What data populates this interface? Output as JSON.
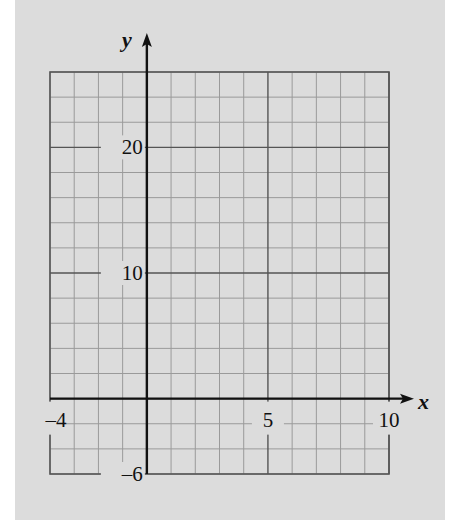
{
  "chart_data": {
    "type": "line",
    "title": "",
    "xlabel": "x",
    "ylabel": "y",
    "xlim": [
      -4,
      10
    ],
    "ylim": [
      -6,
      26
    ],
    "x_ticks": [
      {
        "value": -4,
        "label": "–4"
      },
      {
        "value": 5,
        "label": "5"
      },
      {
        "value": 10,
        "label": "10"
      }
    ],
    "y_ticks": [
      {
        "value": 20,
        "label": "20"
      },
      {
        "value": 10,
        "label": "10"
      },
      {
        "value": -6,
        "label": "–6"
      }
    ],
    "grid": true,
    "minor_grid_x_step": 1,
    "minor_grid_y_step": 2,
    "major_grid_x_step": 5,
    "major_grid_y_step": 10,
    "series": [],
    "legend": null
  },
  "colors": {
    "page_bg": "#ffffff",
    "panel_bg": "#dcdcdc",
    "minor_grid": "#9a9a9a",
    "major_grid": "#555555",
    "axis": "#111111",
    "text": "#111111"
  },
  "labels": {
    "x_axis": "x",
    "y_axis": "y"
  }
}
